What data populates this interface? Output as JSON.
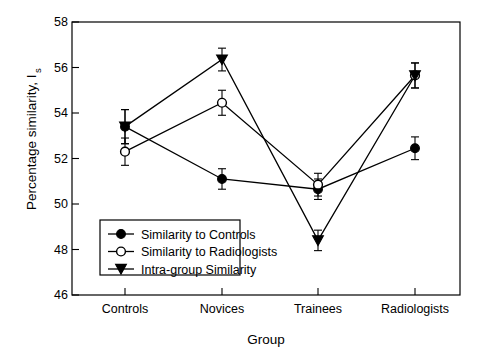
{
  "chart_data": {
    "type": "line",
    "title": "",
    "xlabel": "Group",
    "ylabel": "Percentage similarity, I",
    "ylabel_subscript": "s",
    "categories": [
      "Controls",
      "Novices",
      "Trainees",
      "Radiologists"
    ],
    "ylim": [
      46,
      58
    ],
    "yticks": [
      46,
      48,
      50,
      52,
      54,
      56,
      58
    ],
    "ytick_labels": [
      "46",
      "48",
      "50",
      "52",
      "54",
      "56",
      "58"
    ],
    "grid": false,
    "legend_position": "lower-left-inside",
    "series": [
      {
        "name": "Similarity to Controls",
        "marker": "filled-circle",
        "values": [
          53.4,
          51.1,
          50.65,
          52.45
        ],
        "errors": [
          0.75,
          0.45,
          0.45,
          0.5
        ]
      },
      {
        "name": "Similarity to Radiologists",
        "marker": "open-circle",
        "values": [
          52.3,
          54.45,
          50.85,
          55.65
        ],
        "errors": [
          0.6,
          0.55,
          0.5,
          0.55
        ]
      },
      {
        "name": "Intra-group Similarity",
        "marker": "filled-triangle-down",
        "values": [
          53.4,
          56.35,
          48.4,
          55.65
        ],
        "errors": [
          0.75,
          0.5,
          0.45,
          0.55
        ]
      }
    ]
  },
  "legend": {
    "entries": [
      {
        "label": "Similarity to Controls",
        "marker": "filled-circle"
      },
      {
        "label": "Similarity to Radiologists",
        "marker": "open-circle"
      },
      {
        "label": "Intra-group Similarity",
        "marker": "filled-triangle-down"
      }
    ]
  },
  "colors": {
    "ink": "#000000",
    "background": "#ffffff"
  }
}
